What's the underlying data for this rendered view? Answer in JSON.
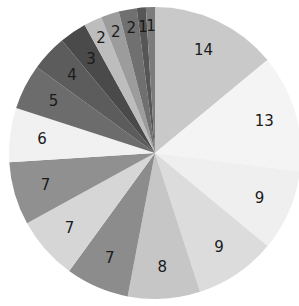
{
  "chart_data": {
    "type": "pie",
    "title": "",
    "start_angle": "12 o'clock",
    "direction": "clockwise",
    "legend": "none",
    "values": [
      14,
      13,
      9,
      9,
      8,
      7,
      7,
      7,
      6,
      5,
      4,
      3,
      2,
      2,
      2,
      1,
      1
    ],
    "labels": [
      "14",
      "13",
      "9",
      "9",
      "8",
      "7",
      "7",
      "7",
      "6",
      "5",
      "4",
      "3",
      "2",
      "2",
      "2",
      "1",
      "1"
    ],
    "colors": [
      "#c9c9c9",
      "#f4f4f4",
      "#efefef",
      "#dcdcdc",
      "#c6c6c6",
      "#8c8c8c",
      "#d6d6d6",
      "#909090",
      "#f1f1f1",
      "#6c6c6c",
      "#5c5c5c",
      "#4a4a4a",
      "#bdbdbd",
      "#9c9c9c",
      "#707070",
      "#565656",
      "#7c7c7c"
    ],
    "total": 100
  }
}
